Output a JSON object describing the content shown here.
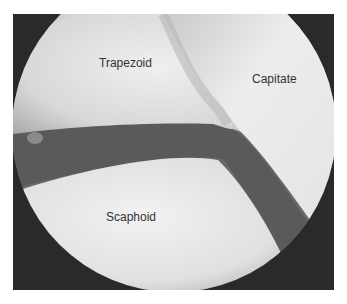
{
  "figure": {
    "labels": [
      {
        "text": "Trapezoid",
        "x": 99,
        "y": 56
      },
      {
        "text": "Capitate",
        "x": 252,
        "y": 72
      },
      {
        "text": "Scaphoid",
        "x": 106,
        "y": 210
      }
    ]
  },
  "colors": {
    "background": "#ffffff",
    "frame": "#2a2a2a",
    "cartilage_light": "#e8e8e8",
    "joint_gap": "#555555",
    "label_text": "#333333"
  }
}
